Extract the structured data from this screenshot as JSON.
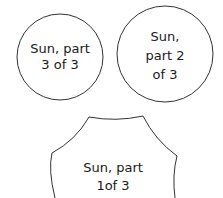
{
  "pieces": [
    {
      "id": "part3",
      "lines": [
        "Sun, part",
        "3 of 3"
      ]
    },
    {
      "id": "part2",
      "lines": [
        "Sun,",
        "part 2",
        "of 3"
      ]
    },
    {
      "id": "part1",
      "lines": [
        "Sun, part",
        "1of 3"
      ]
    }
  ],
  "colors": {
    "stroke": "#333333",
    "fill": "#ffffff",
    "text": "#1a1a1a"
  }
}
